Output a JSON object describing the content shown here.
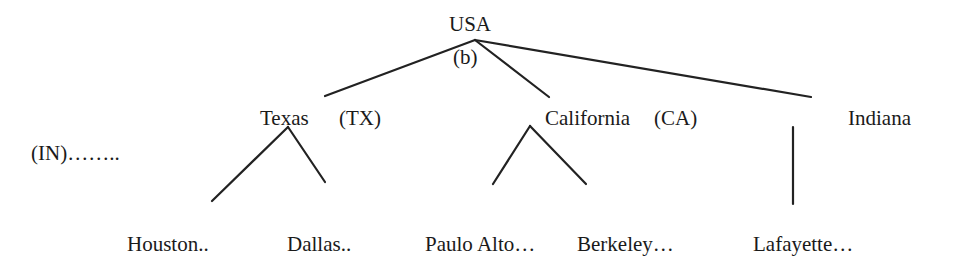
{
  "diagram": {
    "type": "tree",
    "root": {
      "label": "USA",
      "annotation": "(b)"
    },
    "states": [
      {
        "name": "Texas",
        "abbr": "(TX)"
      },
      {
        "name": "California",
        "abbr": "(CA)"
      },
      {
        "name": "Indiana",
        "abbr": "(IN)",
        "abbr_text": "(IN)…….."
      }
    ],
    "cities": [
      {
        "label": "Houston..",
        "state": "Texas"
      },
      {
        "label": "Dallas..",
        "state": "Texas"
      },
      {
        "label": "Paulo Alto…",
        "state": "California"
      },
      {
        "label": "Berkeley…",
        "state": "California"
      },
      {
        "label": "Lafayette…",
        "state": "Indiana"
      }
    ],
    "line_color": "#222222"
  }
}
